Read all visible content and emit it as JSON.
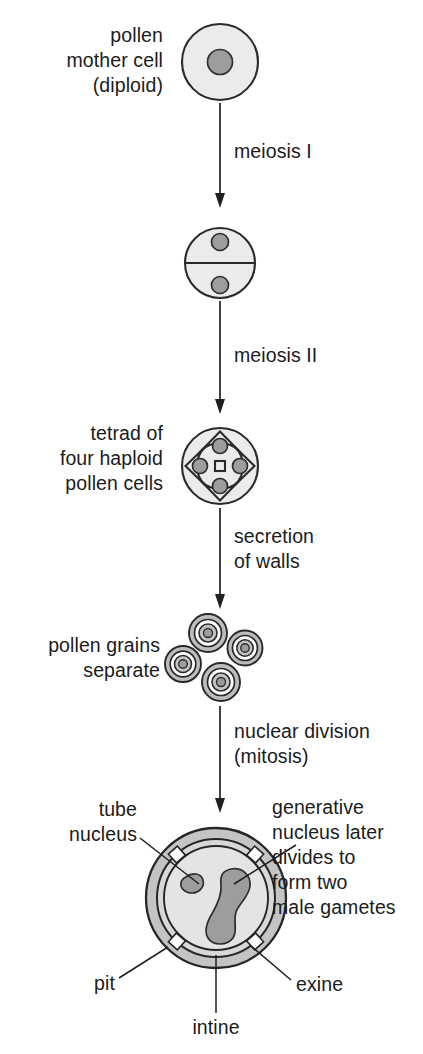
{
  "figure": {
    "colors": {
      "cell_fill": "#ebebeb",
      "nucleus_fill": "#9d9d9d",
      "outline": "#2a2a2a",
      "exine_fill": "#c4c4c4",
      "intine_fill": "#d8d8d8",
      "cytoplasm_fill": "#e4e4e4",
      "text": "#1b1b1b",
      "caption_text": "#5a5a5a"
    }
  },
  "stages": [
    {
      "id": "pollen-mother-cell",
      "label_lines": [
        "pollen",
        "mother cell",
        "(diploid)"
      ],
      "label_align": "right",
      "nuclei": 1,
      "ploidy": "diploid"
    },
    {
      "id": "two-cell-stage",
      "label_lines": [],
      "label_align": "none",
      "nuclei": 2,
      "ploidy": "haploid"
    },
    {
      "id": "tetrad",
      "label_lines": [
        "tetrad of",
        "four haploid",
        "pollen cells"
      ],
      "label_align": "right",
      "nuclei": 4,
      "ploidy": "haploid"
    },
    {
      "id": "pollen-grains-separate",
      "label_lines": [
        "pollen grains",
        "separate"
      ],
      "label_align": "right",
      "grains": 4
    },
    {
      "id": "mature-pollen-grain",
      "label_lines": [],
      "label_align": "none",
      "nuclei": 2
    }
  ],
  "arrows": [
    {
      "id": "arrow-meiosis-1",
      "label_lines": [
        "meiosis I"
      ]
    },
    {
      "id": "arrow-meiosis-2",
      "label_lines": [
        "meiosis II"
      ]
    },
    {
      "id": "arrow-secretion",
      "label_lines": [
        "secretion",
        "of walls"
      ]
    },
    {
      "id": "arrow-mitosis",
      "label_lines": [
        "nuclear division",
        "(mitosis)"
      ]
    }
  ],
  "grain_labels": {
    "tube_nucleus": [
      "tube",
      "nucleus"
    ],
    "generative_nucleus": [
      "generative",
      "nucleus later",
      "divides to",
      "form two",
      "male gametes"
    ],
    "pit": "pit",
    "intine": "intine",
    "exine": "exine"
  },
  "caption": ""
}
